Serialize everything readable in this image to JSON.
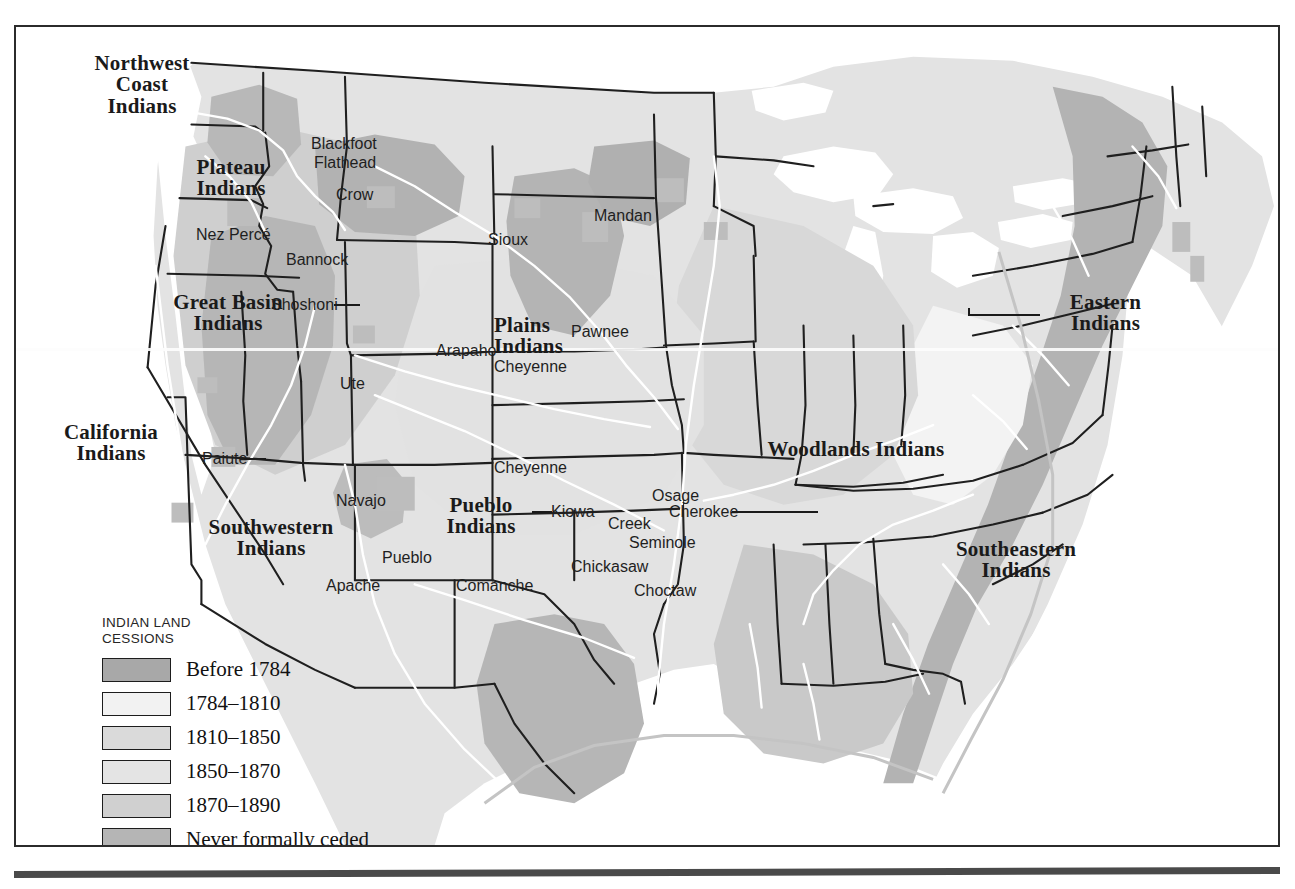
{
  "figure": {
    "kind": "historical-thematic-map",
    "frame_border_color": "#2b2b2b"
  },
  "legend": {
    "title": "INDIAN LAND\nCESSIONS",
    "entries": [
      {
        "label": "Before 1784",
        "color": "#a8a8a8"
      },
      {
        "label": "1784–1810",
        "color": "#f2f2f2"
      },
      {
        "label": "1810–1850",
        "color": "#dadada"
      },
      {
        "label": "1850–1870",
        "color": "#e4e4e4"
      },
      {
        "label": "1870–1890",
        "color": "#d0d0d0"
      },
      {
        "label": "Never formally ceded",
        "color": "#b5b5b5"
      }
    ]
  },
  "culture_areas": [
    {
      "name": "Northwest Coast Indians",
      "lines": [
        "Northwest",
        "Coast",
        "Indians"
      ],
      "x": 46,
      "y": 26,
      "w": 160
    },
    {
      "name": "Plateau Indians",
      "lines": [
        "Plateau",
        "Indians"
      ],
      "x": 150,
      "y": 130,
      "w": 130
    },
    {
      "name": "Great Basin Indians",
      "lines": [
        "Great Basin",
        "Indians"
      ],
      "x": 122,
      "y": 265,
      "w": 180
    },
    {
      "name": "California Indians",
      "lines": [
        "California",
        "Indians"
      ],
      "x": 25,
      "y": 395,
      "w": 140
    },
    {
      "name": "Southwestern Indians",
      "lines": [
        "Southwestern",
        "Indians"
      ],
      "x": 160,
      "y": 490,
      "w": 190
    },
    {
      "name": "Plains Indians",
      "lines": [
        "Plains",
        "Indians"
      ],
      "x": 478,
      "y": 288,
      "w": 115
    },
    {
      "name": "Pueblo Indians",
      "lines": [
        "Pueblo",
        "Indians"
      ],
      "x": 400,
      "y": 468,
      "w": 130
    },
    {
      "name": "Woodlands Indians",
      "lines": [
        "Woodlands Indians"
      ],
      "x": 730,
      "y": 412,
      "w": 220
    },
    {
      "name": "Eastern Indians",
      "lines": [
        "Eastern",
        "Indians"
      ],
      "x": 1022,
      "y": 265,
      "w": 135
    },
    {
      "name": "Southeastern Indians",
      "lines": [
        "Southeastern",
        "Indians"
      ],
      "x": 905,
      "y": 512,
      "w": 190
    }
  ],
  "tribes": [
    {
      "name": "Blackfoot",
      "x": 295,
      "y": 116
    },
    {
      "name": "Flathead",
      "x": 298,
      "y": 135
    },
    {
      "name": "Crow",
      "x": 320,
      "y": 167
    },
    {
      "name": "Nez Percé",
      "x": 193,
      "y": 207
    },
    {
      "name": "Bannock",
      "x": 283,
      "y": 232
    },
    {
      "name": "Shoshoni",
      "x": 268,
      "y": 277
    },
    {
      "name": "Mandan",
      "x": 588,
      "y": 188
    },
    {
      "name": "Sioux",
      "x": 481,
      "y": 212
    },
    {
      "name": "Pawnee",
      "x": 561,
      "y": 304
    },
    {
      "name": "Arapaho",
      "x": 430,
      "y": 323
    },
    {
      "name": "Ute",
      "x": 333,
      "y": 356
    },
    {
      "name": "Cheyenne",
      "x": 489,
      "y": 339
    },
    {
      "name": "Cheyenne2",
      "label": "Cheyenne",
      "x": 489,
      "y": 440
    },
    {
      "name": "Paiute",
      "x": 198,
      "y": 431
    },
    {
      "name": "Navajo",
      "x": 330,
      "y": 473
    },
    {
      "name": "Pueblo",
      "x": 376,
      "y": 530
    },
    {
      "name": "Apache",
      "x": 320,
      "y": 558
    },
    {
      "name": "Comanche",
      "x": 452,
      "y": 558
    },
    {
      "name": "Kiowa",
      "x": 545,
      "y": 484
    },
    {
      "name": "Osage",
      "x": 646,
      "y": 468
    },
    {
      "name": "Creek",
      "x": 601,
      "y": 496
    },
    {
      "name": "Cherokee",
      "x": 663,
      "y": 484
    },
    {
      "name": "Seminole",
      "x": 622,
      "y": 515
    },
    {
      "name": "Chickasaw",
      "x": 567,
      "y": 539
    },
    {
      "name": "Choctaw",
      "x": 628,
      "y": 563
    }
  ],
  "map_palette": {
    "land_base": "#e3e3e3",
    "water": "#ffffff",
    "cession_before_1784": "#a8a8a8",
    "cession_1784_1810": "#f2f2f2",
    "cession_1810_1850": "#dadada",
    "cession_1850_1870": "#e4e4e4",
    "cession_1870_1890": "#d0d0d0",
    "never_ceded": "#b5b5b5",
    "state_border": "#1f1f1f",
    "river": "#ffffff"
  }
}
